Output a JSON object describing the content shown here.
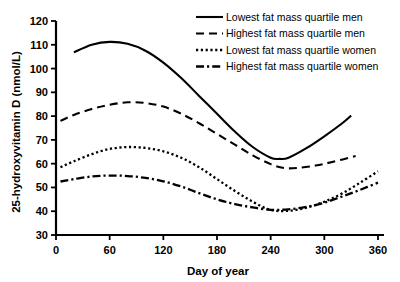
{
  "chart_data": {
    "type": "line",
    "title": "",
    "xlabel": "Day of year",
    "ylabel": "25-hydroxyvitamin D (nmol/L)",
    "xlim": [
      0,
      365
    ],
    "ylim": [
      30,
      120
    ],
    "xticks": [
      0,
      60,
      120,
      180,
      240,
      300,
      360
    ],
    "xtick_labels": [
      "0",
      "60",
      "120",
      "180",
      "240",
      "300",
      "360"
    ],
    "yticks": [
      30,
      40,
      50,
      60,
      70,
      80,
      90,
      100,
      110,
      120
    ],
    "ytick_labels": [
      "30",
      "40",
      "50",
      "60",
      "70",
      "80",
      "90",
      "100",
      "110",
      "120"
    ],
    "grid": false,
    "legend_position": "top-right",
    "line_color": "#000000",
    "series": [
      {
        "name": "Lowest fat mass quartile men",
        "dash": "solid",
        "x": [
          20,
          40,
          60,
          80,
          100,
          120,
          140,
          160,
          180,
          200,
          220,
          240,
          250,
          260,
          280,
          300,
          320,
          330
        ],
        "values": [
          106.8,
          110.0,
          111.2,
          110.4,
          107.5,
          102.5,
          96.0,
          88.5,
          81.0,
          73.5,
          67.0,
          62.5,
          62.0,
          62.5,
          66.5,
          71.5,
          77.0,
          80.2
        ]
      },
      {
        "name": "Highest fat mass quartile men",
        "dash": "dashed",
        "x": [
          5,
          20,
          40,
          60,
          80,
          100,
          120,
          140,
          160,
          180,
          200,
          220,
          240,
          255,
          270,
          290,
          310,
          335
        ],
        "values": [
          78.0,
          80.5,
          83.0,
          84.8,
          85.8,
          85.5,
          84.0,
          81.0,
          77.0,
          72.5,
          68.0,
          63.5,
          59.8,
          58.2,
          58.2,
          59.2,
          60.8,
          63.2
        ]
      },
      {
        "name": "Lowest fat mass quartile women",
        "dash": "dotted",
        "x": [
          5,
          20,
          40,
          60,
          80,
          100,
          120,
          140,
          160,
          180,
          200,
          220,
          240,
          260,
          280,
          300,
          320,
          340,
          360
        ],
        "values": [
          58.5,
          61.0,
          64.0,
          66.2,
          67.0,
          66.6,
          65.2,
          62.5,
          58.5,
          53.5,
          48.5,
          44.0,
          40.5,
          40.2,
          41.5,
          44.0,
          47.5,
          52.0,
          56.8
        ]
      },
      {
        "name": "Highest fat mass quartile women",
        "dash": "dashdot",
        "x": [
          5,
          20,
          40,
          60,
          80,
          100,
          120,
          140,
          160,
          180,
          200,
          220,
          240,
          260,
          280,
          300,
          320,
          340,
          360
        ],
        "values": [
          52.5,
          53.5,
          54.6,
          55.0,
          54.8,
          54.0,
          52.6,
          50.4,
          47.6,
          45.0,
          43.0,
          41.6,
          40.6,
          40.8,
          41.8,
          43.6,
          46.2,
          49.0,
          52.0
        ]
      }
    ]
  },
  "legend": {
    "items": [
      {
        "label": "Lowest fat mass quartile men"
      },
      {
        "label": "Highest fat mass quartile men"
      },
      {
        "label": "Lowest fat mass quartile women"
      },
      {
        "label": "Highest fat mass quartile women"
      }
    ]
  }
}
